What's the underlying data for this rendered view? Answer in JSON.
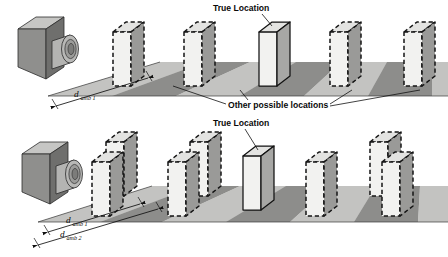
{
  "figure": {
    "name": "range-ambiguity-diagram",
    "width": 448,
    "height": 257
  },
  "palette": {
    "slab_front": "#f2f2f0",
    "slab_side": "#9a9a98",
    "slab_top": "#e3e3e1",
    "slab_outline_solid": "#1a1a1a",
    "slab_outline_ghost": "#141414",
    "ground_light": "#bfbfbd",
    "ground_dark": "#8d8d8b",
    "ground_pale": "#d6d6d4",
    "camera_front": "#8f8f8d",
    "camera_side": "#6f6f6d",
    "camera_top": "#c6c6c4",
    "lens_outer": "#b4b4b2",
    "lens_mid": "#9c9c9a",
    "lens_inner": "#7c7c7a",
    "line": "#111111",
    "text": "#0a0a0a"
  },
  "scenes": [
    {
      "id": "top-scene",
      "name": "single-ambiguity-scene",
      "true_location_label": "True Location",
      "other_locations_label": "Other possible locations",
      "dimension_labels": [
        {
          "var": "d",
          "sub": "amb 1"
        }
      ],
      "slabs": [
        {
          "kind": "ghost",
          "index": 1
        },
        {
          "kind": "ghost",
          "index": 2
        },
        {
          "kind": "true",
          "index": 3
        },
        {
          "kind": "ghost",
          "index": 4
        },
        {
          "kind": "ghost",
          "index": 5
        }
      ]
    },
    {
      "id": "bottom-scene",
      "name": "dual-ambiguity-scene",
      "true_location_label": "True Location",
      "dimension_labels": [
        {
          "var": "d",
          "sub": "amb 1"
        },
        {
          "var": "d",
          "sub": "amb 2"
        }
      ],
      "slabs": [
        {
          "kind": "ghost",
          "index": 1
        },
        {
          "kind": "ghost",
          "index": 2
        },
        {
          "kind": "ghost",
          "index": 3
        },
        {
          "kind": "ghost",
          "index": 4
        },
        {
          "kind": "true",
          "index": 5
        },
        {
          "kind": "ghost",
          "index": 6
        },
        {
          "kind": "ghost",
          "index": 7
        },
        {
          "kind": "ghost",
          "index": 8
        }
      ]
    }
  ],
  "labels": {
    "true_location_top": "True Location",
    "other_possible_locations": "Other possible locations",
    "true_location_bottom": "True Location",
    "d_amb_1_top": {
      "var": "d",
      "sub": "amb 1"
    },
    "d_amb_1_bottom": {
      "var": "d",
      "sub": "amb 1"
    },
    "d_amb_2_bottom": {
      "var": "d",
      "sub": "amb 2"
    }
  },
  "camera": {
    "name": "sensor-camera",
    "count": 2
  }
}
